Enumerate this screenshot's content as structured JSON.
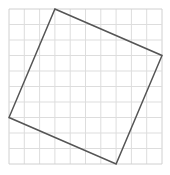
{
  "diagram": {
    "type": "grid-with-tilted-square",
    "grid": {
      "cols": 10,
      "rows": 10,
      "origin_px": [
        9,
        9
      ],
      "cell_px": [
        15.3,
        15.5
      ],
      "line_color": "#dddddd",
      "border_color": "#d0d0d0"
    },
    "square": {
      "vertices_grid": [
        [
          3,
          0
        ],
        [
          10,
          3
        ],
        [
          7,
          10
        ],
        [
          0,
          7
        ]
      ],
      "stroke_color": "#555555",
      "stroke_width": 1.5
    }
  }
}
